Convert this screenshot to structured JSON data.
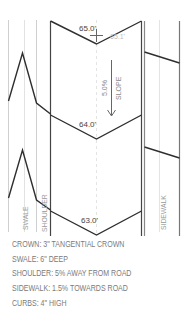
{
  "diagram": {
    "type": "road cross-section plan",
    "elevations": {
      "top_left": "65.0'",
      "top_right": "65.1'",
      "middle": "64.0'",
      "bottom": "63.0'"
    },
    "slope": {
      "percent": "5.0%",
      "label": "SLOPE"
    },
    "zone_labels": {
      "swale": "SWALE",
      "shoulder": "SHOULDER",
      "sidewalk": "SIDEWALK"
    },
    "colors": {
      "line_dark": "#333333",
      "line_light": "#c8c8c8",
      "text": "#7a7a7a"
    }
  },
  "notes": [
    "CROWN: 3\" TANGENTIAL CROWN",
    "SWALE: 6\" DEEP",
    "SHOULDER: 5% AWAY FROM ROAD",
    "SIDEWALK: 1.5% TOWARDS ROAD",
    "CURBS: 4\" HIGH"
  ]
}
